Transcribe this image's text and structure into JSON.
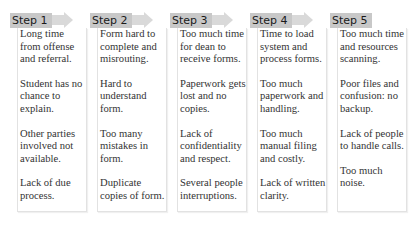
{
  "colors": {
    "header_bg": "#c8c8c8",
    "arrow": "#d9d9d9",
    "text": "#333333"
  },
  "steps": [
    {
      "label": "Step 1",
      "has_arrow": true,
      "items": [
        "Long time from offense and referral.",
        "Student has no chance to explain.",
        "Other parties involved not available.",
        "Lack of due process."
      ]
    },
    {
      "label": "Step 2",
      "has_arrow": true,
      "items": [
        "Form hard to complete and misrouting.",
        "Hard to understand form.",
        "Too many mistakes in form.",
        "Duplicate copies of form."
      ]
    },
    {
      "label": "Step 3",
      "has_arrow": true,
      "items": [
        "Too much time for dean to receive forms.",
        "Paperwork gets lost and no copies.",
        "Lack of confidentiality and respect.",
        "Several people interruptions."
      ]
    },
    {
      "label": "Step 4",
      "has_arrow": true,
      "items": [
        "Time to load system and process forms.",
        "Too much paperwork and handling.",
        "Too much manual filing and costly.",
        "Lack of written clarity."
      ]
    },
    {
      "label": "Step 5",
      "has_arrow": false,
      "items": [
        "Too much time and resources scanning.",
        "Poor files and confusion: no backup.",
        "Lack of people to handle calls.",
        "Too much noise."
      ]
    }
  ]
}
